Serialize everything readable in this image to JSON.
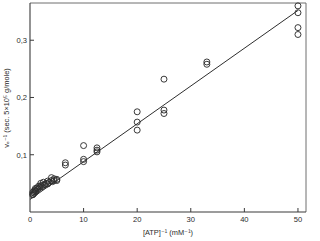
{
  "chart_data": {
    "type": "scatter",
    "title": "",
    "subtitle": "",
    "xlabel": "[ATP]⁻¹ (mM⁻¹)",
    "ylabel": "vₑ⁻¹ (sec. 5×10⁵ g/mole)",
    "xlim": [
      0,
      51.5
    ],
    "ylim": [
      0,
      0.365
    ],
    "xticks": [
      0,
      10,
      20,
      30,
      40,
      50
    ],
    "xticklabels": [
      "0",
      "10",
      "20",
      "30",
      "40",
      "50"
    ],
    "yticks": [
      0.1,
      0.2,
      0.3
    ],
    "yticklabels": [
      "0,1",
      "0,2",
      "0,3"
    ],
    "grid": false,
    "legend": null,
    "marker": "open-circle",
    "marker_size": 4.0,
    "series": [
      {
        "name": "v_e^-1 vs [ATP]^-1",
        "x": [
          0.5,
          0.5,
          0.6,
          0.7,
          0.8,
          0.9,
          1.0,
          1.0,
          1.1,
          1.3,
          1.5,
          1.6,
          1.8,
          2.0,
          2.0,
          2.2,
          2.5,
          2.5,
          2.8,
          3.0,
          3.3,
          3.3,
          3.6,
          4.0,
          4.0,
          4.2,
          4.5,
          4.5,
          5.0,
          5.0,
          6.6,
          6.6,
          10.0,
          10.0,
          10.0,
          12.5,
          12.5,
          12.5,
          20.0,
          20.0,
          20.0,
          25.0,
          25.0,
          25.0,
          33.0,
          33.0,
          50.0,
          50.0,
          50.0,
          50.0
        ],
        "y": [
          0.03,
          0.034,
          0.031,
          0.036,
          0.033,
          0.038,
          0.035,
          0.041,
          0.037,
          0.042,
          0.04,
          0.045,
          0.043,
          0.046,
          0.05,
          0.044,
          0.047,
          0.052,
          0.048,
          0.05,
          0.049,
          0.054,
          0.052,
          0.055,
          0.06,
          0.053,
          0.055,
          0.058,
          0.055,
          0.057,
          0.082,
          0.086,
          0.088,
          0.092,
          0.116,
          0.105,
          0.108,
          0.112,
          0.143,
          0.157,
          0.175,
          0.172,
          0.178,
          0.232,
          0.258,
          0.262,
          0.31,
          0.322,
          0.348,
          0.36
        ]
      }
    ],
    "fit_line": {
      "name": "linear regression",
      "x": [
        0.0,
        50.0
      ],
      "y": [
        0.022,
        0.352
      ],
      "slope": 0.0066,
      "intercept": 0.022
    }
  },
  "axes": {
    "x_axis_name": "x-axis",
    "y_axis_name": "y-axis"
  }
}
